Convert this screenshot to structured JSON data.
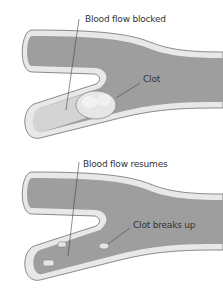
{
  "diagram": {
    "panels": [
      {
        "id": "blocked",
        "labels": {
          "flow": "Blood flow blocked",
          "clot": "Clot"
        }
      },
      {
        "id": "resumed",
        "labels": {
          "flow": "Blood flow resumes",
          "clot": "Clot breaks up"
        }
      }
    ],
    "colors": {
      "vessel_wall": "#e6e6e6",
      "vessel_outline": "#6e6e6e",
      "blood": "#9a9a9a",
      "blocked_branch": "#d2d2d2",
      "clot": "#e4e4e4",
      "leader_line": "#444444"
    }
  }
}
